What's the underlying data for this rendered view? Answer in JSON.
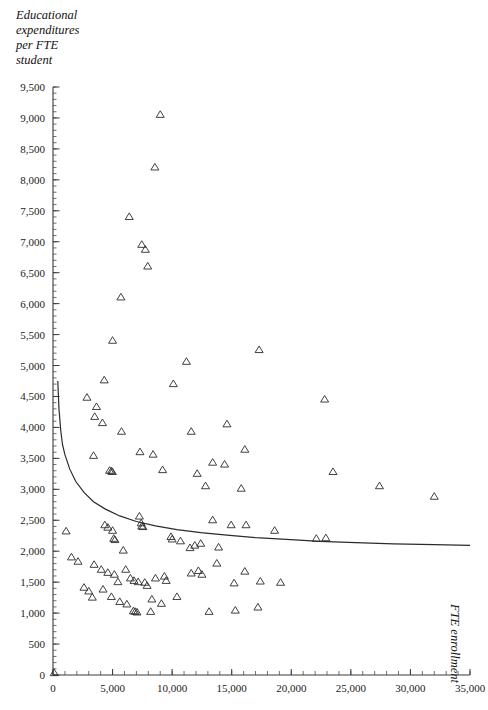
{
  "chart_data": {
    "type": "scatter",
    "title": "",
    "ylabel": "Educational\nexpenditures\nper FTE\nstudent",
    "xlabel": "FTE enrollment",
    "xlim": [
      0,
      35000
    ],
    "ylim": [
      0,
      9500
    ],
    "grid": false,
    "legend": null,
    "marker": "open-triangle",
    "x_ticks": [
      0,
      5000,
      10000,
      15000,
      20000,
      25000,
      30000,
      35000
    ],
    "x_tick_labels": [
      "0",
      "5,000",
      "10,000",
      "15,000",
      "20,000",
      "25,000",
      "30,000",
      "35,000"
    ],
    "x_minor_tick_step": 1000,
    "y_ticks": [
      0,
      500,
      1000,
      1500,
      2000,
      2500,
      3000,
      3500,
      4000,
      4500,
      5000,
      5500,
      6000,
      6500,
      7000,
      7500,
      8000,
      8500,
      9000,
      9500
    ],
    "y_tick_labels": [
      "0",
      "500",
      "1,000",
      "1,500",
      "2,000",
      "2,500",
      "3,000",
      "3,500",
      "4,000",
      "4,500",
      "5,000",
      "5,500",
      "6,000",
      "6,500",
      "7,000",
      "7,500",
      "8,000",
      "8,500",
      "9,000",
      "9,500"
    ],
    "y_minor_tick_step": 100,
    "series": [
      {
        "name": "institutions",
        "marker": "open-triangle",
        "points": [
          [
            9000,
            9050
          ],
          [
            8550,
            8200
          ],
          [
            6400,
            7400
          ],
          [
            7450,
            6950
          ],
          [
            7750,
            6870
          ],
          [
            7950,
            6600
          ],
          [
            5700,
            6100
          ],
          [
            5000,
            5400
          ],
          [
            17300,
            5250
          ],
          [
            11200,
            5060
          ],
          [
            4300,
            4760
          ],
          [
            10100,
            4700
          ],
          [
            22800,
            4450
          ],
          [
            2850,
            4480
          ],
          [
            3650,
            4330
          ],
          [
            3500,
            4170
          ],
          [
            4150,
            4070
          ],
          [
            14600,
            4050
          ],
          [
            5750,
            3930
          ],
          [
            11600,
            3930
          ],
          [
            16100,
            3640
          ],
          [
            7300,
            3600
          ],
          [
            8400,
            3560
          ],
          [
            3400,
            3540
          ],
          [
            13400,
            3430
          ],
          [
            14400,
            3400
          ],
          [
            4750,
            3300
          ],
          [
            4900,
            3290
          ],
          [
            4980,
            3280
          ],
          [
            9200,
            3310
          ],
          [
            12100,
            3250
          ],
          [
            23500,
            3280
          ],
          [
            15800,
            3010
          ],
          [
            12800,
            3050
          ],
          [
            27400,
            3050
          ],
          [
            32000,
            2880
          ],
          [
            1100,
            2320
          ],
          [
            4350,
            2420
          ],
          [
            4600,
            2380
          ],
          [
            7250,
            2560
          ],
          [
            7400,
            2450
          ],
          [
            7450,
            2400
          ],
          [
            7550,
            2390
          ],
          [
            13400,
            2500
          ],
          [
            16200,
            2420
          ],
          [
            18600,
            2330
          ],
          [
            22100,
            2200
          ],
          [
            22900,
            2210
          ],
          [
            5000,
            2330
          ],
          [
            5100,
            2200
          ],
          [
            5200,
            2180
          ],
          [
            9900,
            2230
          ],
          [
            10000,
            2190
          ],
          [
            10700,
            2160
          ],
          [
            1550,
            1900
          ],
          [
            2100,
            1830
          ],
          [
            3450,
            1780
          ],
          [
            4050,
            1700
          ],
          [
            4600,
            1650
          ],
          [
            5150,
            1620
          ],
          [
            5450,
            1500
          ],
          [
            6100,
            1700
          ],
          [
            6500,
            1560
          ],
          [
            6800,
            1520
          ],
          [
            7150,
            1500
          ],
          [
            7700,
            1490
          ],
          [
            7900,
            1440
          ],
          [
            8600,
            1560
          ],
          [
            9350,
            1590
          ],
          [
            9500,
            1520
          ],
          [
            2600,
            1410
          ],
          [
            3000,
            1350
          ],
          [
            3300,
            1250
          ],
          [
            4200,
            1380
          ],
          [
            4900,
            1260
          ],
          [
            5600,
            1180
          ],
          [
            6200,
            1140
          ],
          [
            6750,
            1030
          ],
          [
            6900,
            1020
          ],
          [
            7050,
            1010
          ],
          [
            8200,
            1020
          ],
          [
            11600,
            1640
          ],
          [
            12200,
            1680
          ],
          [
            12500,
            1620
          ],
          [
            13100,
            1020
          ],
          [
            13750,
            1800
          ],
          [
            15200,
            1480
          ],
          [
            16100,
            1670
          ],
          [
            17200,
            1090
          ],
          [
            15300,
            1040
          ],
          [
            17400,
            1510
          ],
          [
            19100,
            1490
          ],
          [
            13900,
            2060
          ],
          [
            12400,
            2120
          ],
          [
            11900,
            2090
          ],
          [
            14950,
            2420
          ],
          [
            11500,
            2050
          ],
          [
            8300,
            1220
          ],
          [
            10400,
            1260
          ],
          [
            9100,
            1150
          ],
          [
            5900,
            2010
          ],
          [
            100,
            30
          ]
        ]
      }
    ],
    "fit_curve": {
      "description": "declining power-law fit",
      "points": [
        [
          400,
          4750
        ],
        [
          500,
          4300
        ],
        [
          650,
          3950
        ],
        [
          800,
          3720
        ],
        [
          1000,
          3560
        ],
        [
          1400,
          3330
        ],
        [
          1900,
          3130
        ],
        [
          2600,
          2950
        ],
        [
          3400,
          2800
        ],
        [
          4400,
          2680
        ],
        [
          5600,
          2570
        ],
        [
          7000,
          2480
        ],
        [
          8600,
          2410
        ],
        [
          10400,
          2350
        ],
        [
          12400,
          2300
        ],
        [
          14600,
          2260
        ],
        [
          17000,
          2220
        ],
        [
          19600,
          2190
        ],
        [
          22400,
          2160
        ],
        [
          25400,
          2140
        ],
        [
          28600,
          2120
        ],
        [
          32000,
          2105
        ],
        [
          35000,
          2095
        ]
      ]
    }
  }
}
